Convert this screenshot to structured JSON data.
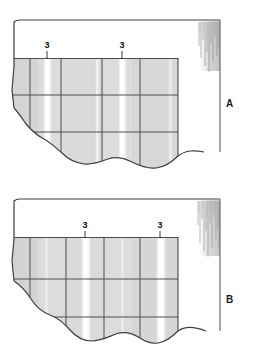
{
  "figure": {
    "background_color": "#ffffff",
    "width": 262,
    "height": 362
  },
  "style": {
    "rock_fill": "#d9d9d9",
    "rock_fill_light": "#e4e4e4",
    "joint_line_color": "#555555",
    "outline_color": "#3a3a3a",
    "fracture_fill": "#ffffff",
    "hatch_color": "#9a9a9a",
    "label_color": "#1a1a1a"
  },
  "panels": [
    {
      "id": "panel-a",
      "label": "A",
      "callouts": [
        {
          "text": "3",
          "x": 47,
          "y": 60
        },
        {
          "text": "3",
          "x": 122,
          "y": 60
        }
      ]
    },
    {
      "id": "panel-b",
      "label": "B",
      "callouts": [
        {
          "text": "3",
          "x": 85,
          "y": 59
        },
        {
          "text": "3",
          "x": 160,
          "y": 59
        }
      ]
    }
  ]
}
